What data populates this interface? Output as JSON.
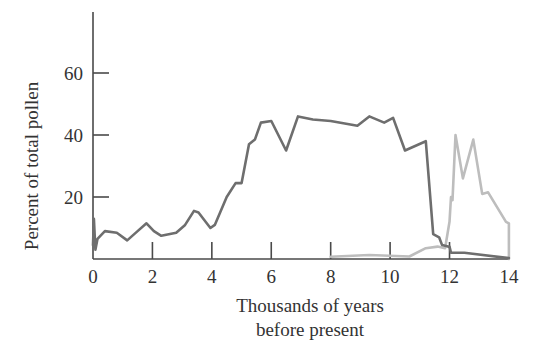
{
  "chart_data": {
    "type": "line",
    "title": "",
    "xlabel": "Thousands of years before present",
    "xlabel_lines": [
      "Thousands of years",
      "before present"
    ],
    "ylabel": "Percent of total pollen",
    "xlim": [
      0,
      14
    ],
    "ylim": [
      0,
      80
    ],
    "x_ticks": [
      0,
      2,
      4,
      6,
      8,
      10,
      12,
      14
    ],
    "x_tick_labels": [
      "0",
      "2",
      "4",
      "6",
      "8",
      "10",
      "12",
      "14"
    ],
    "y_ticks": [
      20,
      40,
      60
    ],
    "y_tick_labels": [
      "20",
      "40",
      "60"
    ],
    "grid": false,
    "legend": null,
    "series": [
      {
        "name": "dark series",
        "color": "#6e6e6e",
        "points": [
          [
            0.0,
            4.5
          ],
          [
            0.03,
            13
          ],
          [
            0.08,
            3
          ],
          [
            0.15,
            6.5
          ],
          [
            0.4,
            9
          ],
          [
            0.8,
            8.5
          ],
          [
            1.15,
            6
          ],
          [
            1.5,
            9
          ],
          [
            1.8,
            11.5
          ],
          [
            2.05,
            9
          ],
          [
            2.3,
            7.5
          ],
          [
            2.8,
            8.5
          ],
          [
            3.1,
            11
          ],
          [
            3.4,
            15.5
          ],
          [
            3.55,
            15
          ],
          [
            3.95,
            10
          ],
          [
            4.1,
            11
          ],
          [
            4.5,
            20
          ],
          [
            4.8,
            24.5
          ],
          [
            5.0,
            24.5
          ],
          [
            5.25,
            37
          ],
          [
            5.45,
            38.5
          ],
          [
            5.65,
            44
          ],
          [
            6.0,
            44.5
          ],
          [
            6.5,
            35
          ],
          [
            6.9,
            46
          ],
          [
            7.4,
            45
          ],
          [
            8.0,
            44.5
          ],
          [
            8.9,
            43
          ],
          [
            9.3,
            46
          ],
          [
            9.8,
            44
          ],
          [
            10.1,
            45.5
          ],
          [
            10.5,
            35
          ],
          [
            11.2,
            38
          ],
          [
            11.45,
            8
          ],
          [
            11.65,
            7
          ],
          [
            11.75,
            4.5
          ],
          [
            11.95,
            4
          ],
          [
            12.0,
            4
          ],
          [
            12.05,
            2
          ],
          [
            12.5,
            2
          ],
          [
            14.0,
            0.3
          ]
        ]
      },
      {
        "name": "light series",
        "color": "#bdbdbd",
        "points": [
          [
            8.0,
            0.7
          ],
          [
            9.3,
            1.3
          ],
          [
            10.65,
            0.8
          ],
          [
            11.2,
            3.5
          ],
          [
            11.6,
            4
          ],
          [
            11.85,
            3.5
          ],
          [
            12.0,
            12
          ],
          [
            12.05,
            20
          ],
          [
            12.1,
            19
          ],
          [
            12.2,
            40
          ],
          [
            12.45,
            26
          ],
          [
            12.8,
            38.5
          ],
          [
            13.1,
            21
          ],
          [
            13.3,
            21.5
          ],
          [
            13.9,
            12
          ],
          [
            14.0,
            11.5
          ],
          [
            14.0,
            0
          ]
        ]
      }
    ]
  },
  "layout": {
    "plot_left_px": 93,
    "plot_bottom_px": 259,
    "px_per_x_unit": 29.71,
    "px_per_y_unit": 3.1,
    "y_axis_top_px": 12,
    "x_axis_right_px": 509
  }
}
